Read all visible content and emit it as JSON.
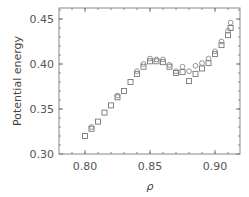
{
  "chart_data": {
    "type": "scatter",
    "title": "",
    "xlabel": "ρ",
    "ylabel": "Potential energy",
    "xlim": [
      0.78,
      0.919
    ],
    "ylim": [
      0.296,
      0.461
    ],
    "xticks": [
      0.8,
      0.85,
      0.9
    ],
    "xtick_labels": [
      "0.80",
      "0.85",
      "0.90"
    ],
    "yticks": [
      0.3,
      0.35,
      0.4,
      0.45
    ],
    "ytick_labels": [
      "0.30",
      "0.35",
      "0.40",
      "0.45"
    ],
    "grid": false,
    "legend": null,
    "series": [
      {
        "name": "squares",
        "marker": "square",
        "x": [
          0.8,
          0.805,
          0.81,
          0.815,
          0.82,
          0.825,
          0.83,
          0.835,
          0.84,
          0.845,
          0.85,
          0.855,
          0.86,
          0.865,
          0.87,
          0.875,
          0.88,
          0.885,
          0.89,
          0.895,
          0.9,
          0.905,
          0.91,
          0.912
        ],
        "y": [
          0.32,
          0.328,
          0.336,
          0.346,
          0.354,
          0.363,
          0.37,
          0.38,
          0.389,
          0.397,
          0.403,
          0.403,
          0.402,
          0.397,
          0.39,
          0.391,
          0.381,
          0.389,
          0.395,
          0.401,
          0.411,
          0.421,
          0.432,
          0.44
        ]
      },
      {
        "name": "circles",
        "marker": "circle",
        "x": [
          0.805,
          0.825,
          0.84,
          0.845,
          0.85,
          0.855,
          0.86,
          0.865,
          0.87,
          0.875,
          0.88,
          0.885,
          0.89,
          0.895,
          0.9,
          0.905,
          0.91,
          0.912
        ],
        "y": [
          0.33,
          0.365,
          0.392,
          0.4,
          0.406,
          0.405,
          0.405,
          0.399,
          0.392,
          0.397,
          0.392,
          0.398,
          0.401,
          0.406,
          0.414,
          0.425,
          0.437,
          0.446
        ]
      }
    ]
  }
}
